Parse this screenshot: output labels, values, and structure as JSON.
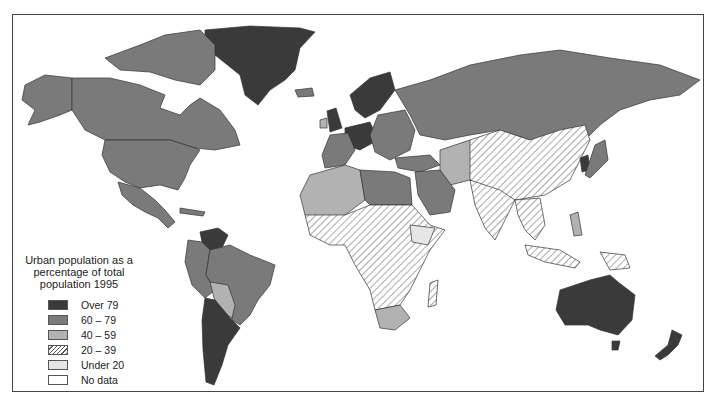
{
  "map": {
    "title": "Urban population as a percentage of total population 1995",
    "legend": {
      "title_lines": [
        "Urban population as a",
        "percentage of total",
        "population 1995"
      ],
      "items": [
        {
          "label": "Over 79",
          "class": "sw-over79",
          "color": "#3a3a3a"
        },
        {
          "label": "60 – 79",
          "class": "sw-60-79",
          "color": "#7a7a7a"
        },
        {
          "label": "40 – 59",
          "class": "sw-40-59",
          "color": "#b2b2b2"
        },
        {
          "label": "20 – 39",
          "class": "sw-20-39",
          "pattern": "diagonal-hatch"
        },
        {
          "label": "Under 20",
          "class": "sw-under20",
          "pattern": "light-stipple"
        },
        {
          "label": "No data",
          "class": "sw-nodata",
          "color": "#ffffff"
        }
      ]
    },
    "regions": [
      {
        "name": "Greenland",
        "category": "Over 79"
      },
      {
        "name": "North America (Canada, USA, Alaska)",
        "category": "60 – 79"
      },
      {
        "name": "Mexico & Central America",
        "category": "60 – 79"
      },
      {
        "name": "Venezuela",
        "category": "Over 79"
      },
      {
        "name": "Brazil",
        "category": "60 – 79"
      },
      {
        "name": "Bolivia / Paraguay",
        "category": "40 – 59"
      },
      {
        "name": "Argentina / Chile / Uruguay",
        "category": "Over 79"
      },
      {
        "name": "Russia",
        "category": "60 – 79"
      },
      {
        "name": "Western Europe / UK / Scandinavia",
        "category": "Over 79"
      },
      {
        "name": "Eastern Europe",
        "category": "60 – 79"
      },
      {
        "name": "North Africa",
        "category": "40 – 59"
      },
      {
        "name": "Libya / Saudi Arabia",
        "category": "60 – 79"
      },
      {
        "name": "Sub-Saharan Africa",
        "category": "20 – 39"
      },
      {
        "name": "Ethiopia",
        "category": "Under 20"
      },
      {
        "name": "South Africa",
        "category": "40 – 59"
      },
      {
        "name": "China / India / SE Asia",
        "category": "20 – 39"
      },
      {
        "name": "Iran / Central Asia",
        "category": "40 – 59"
      },
      {
        "name": "Japan / Korea",
        "category": "60 – 79"
      },
      {
        "name": "Australia / New Zealand",
        "category": "Over 79"
      }
    ]
  }
}
